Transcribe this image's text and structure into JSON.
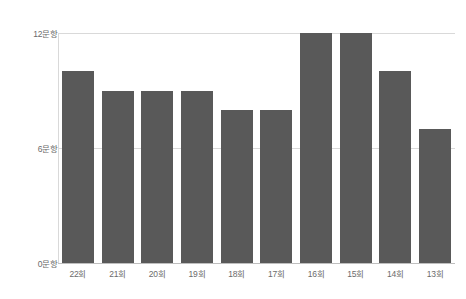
{
  "chart_data": {
    "type": "bar",
    "title": "",
    "subtitle": "",
    "xlabel": "",
    "ylabel": "",
    "categories": [
      "22회",
      "21회",
      "20회",
      "19회",
      "18회",
      "17회",
      "16회",
      "15회",
      "14회",
      "13회"
    ],
    "values": [
      10,
      9,
      9,
      9,
      8,
      8,
      12,
      12,
      10,
      7
    ],
    "data_labels": [
      "10문항",
      "9문항",
      "9문항",
      "9문항",
      "8문항",
      "8문항",
      "12문항",
      "12문항",
      "10문항",
      "7문항"
    ],
    "ylim": [
      0,
      12
    ],
    "y_ticks": [
      0,
      6,
      12
    ],
    "y_tick_labels": [
      "0문항",
      "6문항",
      "12문항"
    ],
    "grid": true,
    "legend": null,
    "legend_position": "none",
    "series": [
      {
        "name": "문항 수",
        "values": [
          10,
          9,
          9,
          9,
          8,
          8,
          12,
          12,
          10,
          7
        ]
      }
    ],
    "colors": {
      "bar": "#595959",
      "gridline": "#d9d9d9",
      "baseline": "#bfbfbf",
      "label_text": "#5a5a5a",
      "tick_text": "#6b6b6b",
      "background": "#ffffff"
    }
  }
}
